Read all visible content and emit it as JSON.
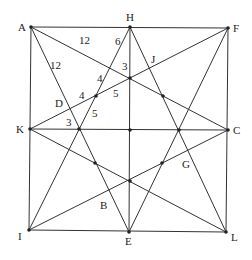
{
  "diagram": {
    "type": "geometry",
    "points": [
      {
        "name": "A",
        "x": 31,
        "y": 27,
        "lx": 18,
        "ly": 31
      },
      {
        "name": "H",
        "x": 130,
        "y": 27,
        "lx": 126,
        "ly": 21
      },
      {
        "name": "F",
        "x": 228,
        "y": 28,
        "lx": 233,
        "ly": 32
      },
      {
        "name": "K",
        "x": 30,
        "y": 129,
        "lx": 16,
        "ly": 133
      },
      {
        "name": "C",
        "x": 228,
        "y": 130,
        "lx": 233,
        "ly": 134
      },
      {
        "name": "I",
        "x": 29,
        "y": 230,
        "lx": 18,
        "ly": 240
      },
      {
        "name": "E",
        "x": 129,
        "y": 232,
        "lx": 125,
        "ly": 245
      },
      {
        "name": "L",
        "x": 226,
        "y": 232,
        "lx": 231,
        "ly": 241
      }
    ],
    "inner_labels": [
      {
        "text": "D",
        "x": 55,
        "y": 107
      },
      {
        "text": "J",
        "x": 151,
        "y": 63
      },
      {
        "text": "G",
        "x": 182,
        "y": 168
      },
      {
        "text": "B",
        "x": 100,
        "y": 209
      }
    ],
    "lengths": [
      {
        "text": "12",
        "x": 79,
        "y": 44
      },
      {
        "text": "12",
        "x": 50,
        "y": 69
      },
      {
        "text": "6",
        "x": 115,
        "y": 45
      },
      {
        "text": "3",
        "x": 122,
        "y": 70
      },
      {
        "text": "4",
        "x": 97,
        "y": 82
      },
      {
        "text": "5",
        "x": 113,
        "y": 97
      },
      {
        "text": "4",
        "x": 79,
        "y": 99
      },
      {
        "text": "5",
        "x": 92,
        "y": 117
      },
      {
        "text": "3",
        "x": 66,
        "y": 126
      }
    ],
    "segments": [
      [
        31,
        27,
        228,
        28
      ],
      [
        228,
        28,
        226,
        232
      ],
      [
        226,
        232,
        29,
        230
      ],
      [
        29,
        230,
        31,
        27
      ],
      [
        130,
        27,
        129,
        232
      ],
      [
        30,
        129,
        228,
        130
      ],
      [
        31,
        27,
        129,
        232
      ],
      [
        31,
        27,
        228,
        130
      ],
      [
        130,
        27,
        29,
        230
      ],
      [
        130,
        27,
        226,
        232
      ],
      [
        228,
        28,
        30,
        129
      ],
      [
        228,
        28,
        129,
        232
      ],
      [
        30,
        129,
        226,
        232
      ],
      [
        29,
        230,
        228,
        130
      ]
    ],
    "dots": [
      [
        31,
        27
      ],
      [
        130,
        27
      ],
      [
        228,
        28
      ],
      [
        30,
        129
      ],
      [
        228,
        130
      ],
      [
        29,
        230
      ],
      [
        129,
        232
      ],
      [
        226,
        232
      ],
      [
        130,
        78
      ],
      [
        130,
        181
      ],
      [
        79,
        129
      ],
      [
        179,
        130
      ],
      [
        130,
        130
      ],
      [
        96,
        96
      ],
      [
        163,
        96
      ],
      [
        95,
        163
      ],
      [
        162,
        163
      ]
    ]
  }
}
